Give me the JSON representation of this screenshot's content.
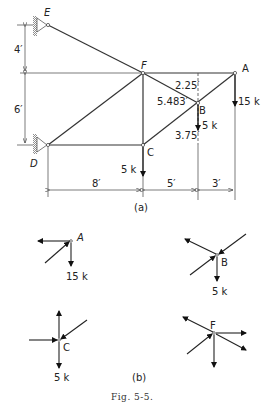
{
  "figure": {
    "caption": "Fig. 5-5.",
    "part_a_label": "(a)",
    "part_b_label": "(b)"
  },
  "truss": {
    "joints": {
      "A": "A",
      "B": "B",
      "C": "C",
      "D": "D",
      "E": "E",
      "F": "F"
    },
    "dimensions": {
      "vertical_upper": "4′",
      "vertical_lower": "6′",
      "horizontal_1": "8′",
      "horizontal_2": "5′",
      "horizontal_3": "3′",
      "B_above": "2.25′",
      "FB_length": "5.483′",
      "B_below": "3.75′"
    },
    "loads": {
      "A": "15 k",
      "B": "5 k",
      "C": "5 k"
    }
  },
  "free_body_diagrams": {
    "A": {
      "label": "A",
      "load": "15 k"
    },
    "B": {
      "label": "B",
      "load": "5 k"
    },
    "C": {
      "label": "C",
      "load": "5 k"
    },
    "F": {
      "label": "F"
    }
  }
}
